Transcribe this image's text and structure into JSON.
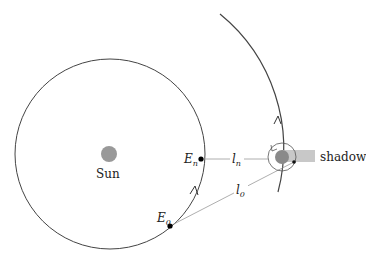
{
  "diagram": {
    "sun_label": "Sun",
    "shadow_label": "shadow",
    "points": {
      "E_n": {
        "base": "E",
        "sub": "n"
      },
      "E_0": {
        "base": "E",
        "sub": "0"
      }
    },
    "distances": {
      "l_n": {
        "base": "l",
        "sub": "n"
      },
      "l_0": {
        "base": "l",
        "sub": "0"
      }
    },
    "colors": {
      "orbit": "#444444",
      "sun": "#999999",
      "planet": "#8a8a8a",
      "shadow": "#c8c8c8",
      "guide_line": "#999999"
    }
  }
}
